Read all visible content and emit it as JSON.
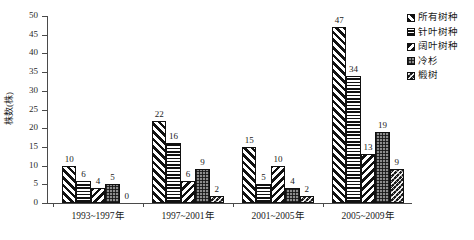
{
  "chart_data": {
    "type": "bar",
    "title": "",
    "xlabel": "",
    "ylabel": "株数(株)",
    "ylim": [
      0,
      50
    ],
    "ytick_step": 5,
    "yticks": [
      50,
      45,
      40,
      35,
      30,
      25,
      20,
      15,
      10,
      5,
      0
    ],
    "grid": false,
    "legend_position": "top-right",
    "categories": [
      "1993~1997年",
      "1997~2001年",
      "2001~2005年",
      "2005~2009年"
    ],
    "series": [
      {
        "name": "所有树种",
        "pattern": "diagonal-stripes",
        "values": [
          10,
          22,
          15,
          47
        ]
      },
      {
        "name": "针叶树种",
        "pattern": "horizontal-stripes",
        "values": [
          6,
          16,
          5,
          34
        ]
      },
      {
        "name": "阔叶树种",
        "pattern": "back-diagonal-stripes",
        "values": [
          4,
          6,
          10,
          13
        ]
      },
      {
        "name": "冷杉",
        "pattern": "dotted-gray",
        "values": [
          5,
          9,
          4,
          19
        ]
      },
      {
        "name": "椴树",
        "pattern": "dark-weave",
        "values": [
          0,
          2,
          2,
          9
        ]
      }
    ],
    "value_labels": [
      [
        10,
        6,
        4,
        5,
        0
      ],
      [
        22,
        16,
        6,
        9,
        2
      ],
      [
        15,
        5,
        10,
        4,
        2
      ],
      [
        47,
        34,
        13,
        19,
        9
      ]
    ],
    "colors": {
      "axis": "#4a4a4a",
      "text": "#1a1a1a",
      "bar_outline": "#111111",
      "background": "#ffffff"
    }
  }
}
